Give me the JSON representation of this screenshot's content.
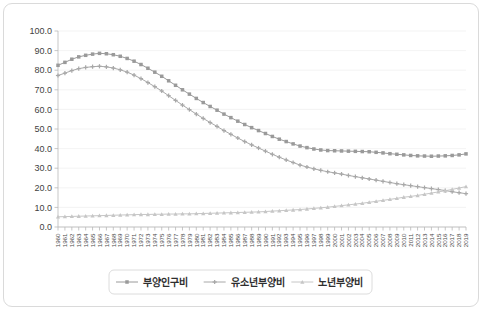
{
  "chart_data": {
    "type": "line",
    "title": "",
    "xlabel": "",
    "ylabel": "",
    "ylim": [
      0,
      100
    ],
    "ytick_step": 10,
    "ytick_labels": [
      "0.0",
      "10.0",
      "20.0",
      "30.0",
      "40.0",
      "50.0",
      "60.0",
      "70.0",
      "80.0",
      "90.0",
      "100.0"
    ],
    "grid": true,
    "legend_position": "bottom",
    "x": [
      1960,
      1961,
      1962,
      1963,
      1964,
      1965,
      1966,
      1967,
      1968,
      1969,
      1970,
      1971,
      1972,
      1973,
      1974,
      1975,
      1976,
      1977,
      1978,
      1979,
      1980,
      1981,
      1982,
      1983,
      1984,
      1985,
      1986,
      1987,
      1988,
      1989,
      1990,
      1991,
      1992,
      1993,
      1994,
      1995,
      1996,
      1997,
      1998,
      1999,
      2000,
      2001,
      2002,
      2003,
      2004,
      2005,
      2006,
      2007,
      2008,
      2009,
      2010,
      2011,
      2012,
      2013,
      2014,
      2015,
      2016,
      2017,
      2018,
      2019
    ],
    "series": [
      {
        "name": "부양인구비",
        "color": "#9a9a9a",
        "marker": "square",
        "values": [
          82.5,
          84.0,
          85.6,
          86.8,
          87.6,
          88.2,
          88.6,
          88.4,
          87.9,
          87.1,
          86.0,
          84.6,
          82.9,
          81.0,
          79.0,
          76.9,
          74.6,
          72.3,
          70.0,
          67.8,
          65.6,
          63.5,
          61.5,
          59.6,
          57.6,
          55.8,
          54.0,
          52.3,
          50.7,
          49.2,
          47.7,
          46.2,
          44.8,
          43.6,
          42.4,
          41.3,
          40.5,
          39.8,
          39.3,
          39.0,
          38.9,
          38.8,
          38.7,
          38.6,
          38.5,
          38.4,
          38.1,
          37.8,
          37.4,
          37.1,
          36.8,
          36.5,
          36.3,
          36.2,
          36.1,
          36.2,
          36.3,
          36.5,
          36.8,
          37.3
        ]
      },
      {
        "name": "유소년부양비",
        "color": "#a8a8a8",
        "marker": "plus",
        "values": [
          77.3,
          78.5,
          79.8,
          80.8,
          81.4,
          81.8,
          82.0,
          81.7,
          81.1,
          80.2,
          79.0,
          77.5,
          75.7,
          73.7,
          71.6,
          69.4,
          67.0,
          64.6,
          62.2,
          59.9,
          57.6,
          55.4,
          53.3,
          51.3,
          49.2,
          47.3,
          45.4,
          43.6,
          41.9,
          40.3,
          38.7,
          37.1,
          35.6,
          34.2,
          32.9,
          31.6,
          30.6,
          29.7,
          28.9,
          28.2,
          27.6,
          27.0,
          26.3,
          25.7,
          25.1,
          24.5,
          23.9,
          23.3,
          22.7,
          22.1,
          21.6,
          21.1,
          20.6,
          20.1,
          19.6,
          19.1,
          18.6,
          18.0,
          17.5,
          17.0
        ]
      },
      {
        "name": "노년부양비",
        "color": "#c6c6c6",
        "marker": "triangle",
        "values": [
          5.2,
          5.3,
          5.4,
          5.5,
          5.6,
          5.7,
          5.8,
          5.9,
          6.0,
          6.1,
          6.2,
          6.3,
          6.4,
          6.4,
          6.5,
          6.5,
          6.6,
          6.6,
          6.7,
          6.7,
          6.8,
          6.9,
          7.0,
          7.1,
          7.2,
          7.3,
          7.4,
          7.5,
          7.6,
          7.7,
          7.9,
          8.1,
          8.3,
          8.5,
          8.7,
          8.9,
          9.2,
          9.5,
          9.8,
          10.1,
          10.5,
          10.9,
          11.3,
          11.7,
          12.1,
          12.6,
          13.1,
          13.6,
          14.1,
          14.6,
          15.2,
          15.6,
          16.1,
          16.7,
          17.3,
          17.9,
          18.5,
          19.2,
          19.9,
          20.6
        ]
      }
    ]
  },
  "axis": {
    "y_tick_labels": [
      "100.0",
      "90.0",
      "80.0",
      "70.0",
      "60.0",
      "50.0",
      "40.0",
      "30.0",
      "20.0",
      "10.0",
      "0.0"
    ]
  },
  "legend": {
    "entries": [
      {
        "label": "부양인구비",
        "color": "#9a9a9a",
        "marker": "square"
      },
      {
        "label": "유소년부양비",
        "color": "#a8a8a8",
        "marker": "plus"
      },
      {
        "label": "노년부양비",
        "color": "#c6c6c6",
        "marker": "triangle"
      }
    ]
  }
}
